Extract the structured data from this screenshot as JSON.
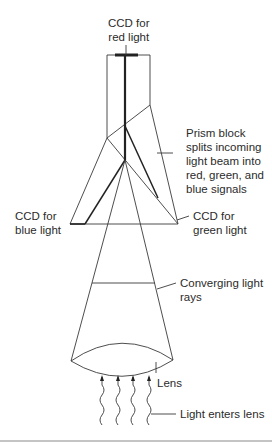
{
  "labels": {
    "ccd_red": "CCD for\nred light",
    "prism": "Prism block\nsplits incoming\nlight beam into\nred, green, and\nblue signals",
    "ccd_blue": "CCD for\nblue light",
    "ccd_green": "CCD for\ngreen light",
    "converging": "Converging light\nrays",
    "lens": "Lens",
    "light_enters": "Light enters lens"
  },
  "components": [
    {
      "id": "ccd-red",
      "name": "CCD for red light"
    },
    {
      "id": "ccd-green",
      "name": "CCD for green light"
    },
    {
      "id": "ccd-blue",
      "name": "CCD for blue light"
    },
    {
      "id": "prism-block",
      "name": "Prism block"
    },
    {
      "id": "lens",
      "name": "Lens"
    },
    {
      "id": "incoming-light",
      "name": "Incoming light",
      "count": 4
    }
  ],
  "colors": {
    "line": "#3a3a3a",
    "beam": "#222222",
    "text": "#2b2b2b",
    "rule": "#8a8a8a"
  }
}
